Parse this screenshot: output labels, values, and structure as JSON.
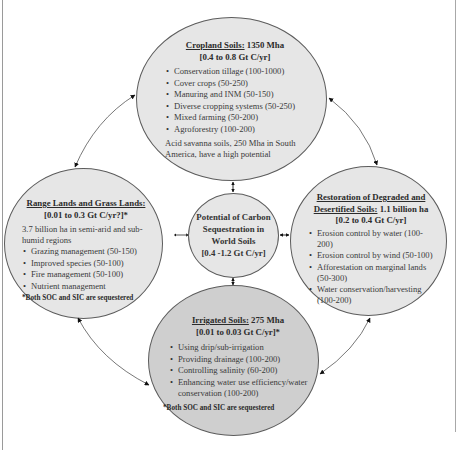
{
  "center": {
    "line1": "Potential of Carbon",
    "line2": "Sequestration in",
    "line3": "World Soils",
    "line4": "[0.4 -1.2 Gt C/yr]"
  },
  "cropland": {
    "title_underlined": "Cropland Soils:",
    "title_rest": " 1350 Mha",
    "rate": "[0.4 to 0.8 Gt C/yr]",
    "items": [
      "Conservation tillage (100-1000)",
      "Cover crops (50-250)",
      "Manuring and INM (50-150)",
      "Diverse cropping systems (50-250)",
      "Mixed farming (50-200)",
      "Agroforestry (100-200)"
    ],
    "note": "Acid savanna soils, 250 Mha in South America, have a high potential"
  },
  "rangelands": {
    "title_underlined": "Range Lands and Grass Lands:",
    "rate": "[0.01 to 0.3 Gt C/yr?]*",
    "desc": "3.7 billion ha in semi-arid and sub-humid regions",
    "items": [
      "Grazing management (50-150)",
      "Improved species (50-100)",
      "Fire management (50-100)",
      "Nutrient management"
    ],
    "footnote": "*Both SOC and SIC are sequestered"
  },
  "restoration": {
    "title_underlined_1": "Restoration of Degraded and",
    "title_underlined_2": "Desertified Soils:",
    "title_rest": " 1.1 billion ha",
    "rate": "[0.2 to 0.4 Gt C/yr]",
    "items": [
      "Erosion control by water (100-200)",
      "Erosion control by wind (50-100)",
      "Afforestation on marginal lands (50-300)",
      "Water conservation/harvesting (100-200)"
    ]
  },
  "irrigated": {
    "title_underlined": "Irrigated Soils:",
    "title_rest": " 275 Mha",
    "rate": "[0.01 to 0.03 Gt C/yr]*",
    "items": [
      "Using drip/sub-irrigation",
      "Providing drainage (100-200)",
      "Controlling salinity (60-200)",
      "Enhancing water use efficiency/water conservation (100-200)"
    ],
    "footnote": "*Both SOC and SIC are sequestered"
  }
}
